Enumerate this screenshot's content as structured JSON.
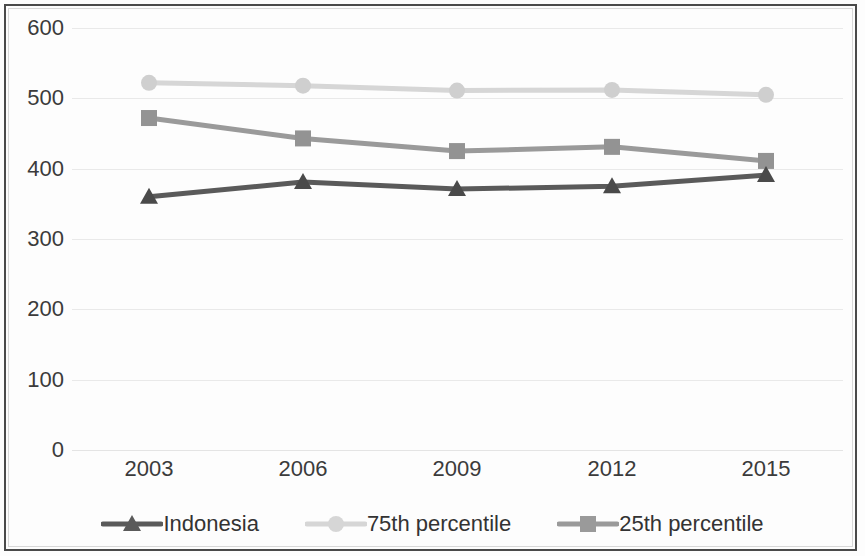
{
  "chart_data": {
    "type": "line",
    "title": "",
    "subtitle": "",
    "xlabel": "",
    "ylabel": "",
    "categories": [
      "2003",
      "2006",
      "2009",
      "2012",
      "2015"
    ],
    "x": [
      2003,
      2006,
      2009,
      2012,
      2015
    ],
    "ylim": [
      0,
      600
    ],
    "yticks": [
      0,
      100,
      200,
      300,
      400,
      500,
      600
    ],
    "ytick_labels": [
      "0",
      "100",
      "200",
      "300",
      "400",
      "500",
      "600"
    ],
    "grid": true,
    "grid_axis": "y",
    "legend_position": "bottom",
    "series": [
      {
        "name": "Indonesia",
        "values": [
          360,
          381,
          371,
          375,
          391
        ],
        "color": "#5a5a5a",
        "marker": "triangle",
        "marker_color": "#4a4a4a"
      },
      {
        "name": "75th percentile",
        "values": [
          522,
          518,
          511,
          512,
          505
        ],
        "color": "#d6d6d6",
        "marker": "circle",
        "marker_color": "#cfcfcf"
      },
      {
        "name": "25th percentile",
        "values": [
          472,
          443,
          425,
          431,
          411
        ],
        "color": "#9a9a9a",
        "marker": "square",
        "marker_color": "#939393"
      }
    ]
  },
  "axes": {
    "y_labels": [
      "600",
      "500",
      "400",
      "300",
      "200",
      "100",
      "0"
    ],
    "x_labels": [
      "2003",
      "2006",
      "2009",
      "2012",
      "2015"
    ]
  },
  "legend": {
    "entries": [
      {
        "label": "Indonesia",
        "color": "#5a5a5a",
        "marker": "triangle"
      },
      {
        "label": "75th percentile",
        "color": "#d6d6d6",
        "marker": "circle"
      },
      {
        "label": "25th percentile",
        "color": "#9a9a9a",
        "marker": "square"
      }
    ]
  },
  "style": {
    "frame_color": "#4a4a4a",
    "grid_color": "#e9e9e9",
    "text_color": "#3b3b3b",
    "background": "#fdfdfd"
  }
}
